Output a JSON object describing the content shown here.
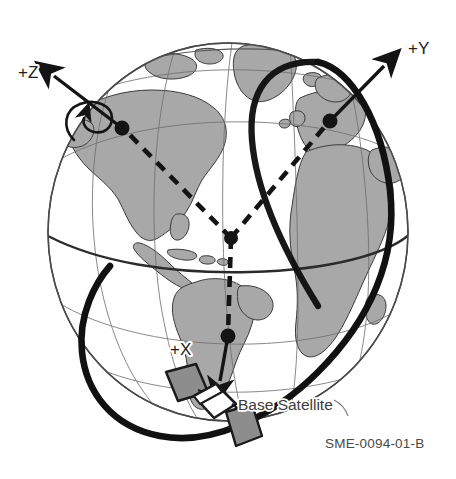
{
  "figure": {
    "background_color": "#ffffff",
    "width": 456,
    "height": 479
  },
  "globe": {
    "name": "earth-globe",
    "center": [
      228,
      232
    ],
    "radius_x": 180,
    "radius_y": 189,
    "ocean_color": "#ffffff",
    "land_color": "#a9a9a9",
    "land_outline_color": "#3b3b3b",
    "graticule_color": "#6e6e6e",
    "equator_color": "#2b2b2b",
    "outline_color": "#4a4a4a"
  },
  "axes": [
    {
      "id": "z",
      "label": "+Z",
      "label_position": [
        18,
        78
      ],
      "origin_dot": [
        122,
        128
      ],
      "arrow_tip": [
        44,
        66
      ],
      "has_rotation_curl": true,
      "color": "#141414"
    },
    {
      "id": "y",
      "label": "+Y",
      "label_position": [
        410,
        52
      ],
      "origin_dot": [
        330,
        121
      ],
      "arrow_tip": [
        390,
        62
      ],
      "has_rotation_curl": false,
      "color": "#141414"
    },
    {
      "id": "x",
      "label": "+X",
      "label_position": [
        172,
        351
      ],
      "origin_dot": [
        228,
        336
      ],
      "arrow_tip": [
        222,
        393
      ],
      "has_rotation_curl": false,
      "color": "#141414"
    }
  ],
  "frame_origin": {
    "name": "earth-center-node",
    "position": [
      231,
      238
    ],
    "color": "#141414"
  },
  "dashed_links": [
    {
      "from": "earth-center-node",
      "to": "z-axis-origin"
    },
    {
      "from": "earth-center-node",
      "to": "y-axis-origin"
    },
    {
      "from": "earth-center-node",
      "to": "x-axis-origin"
    }
  ],
  "orbit": {
    "name": "satellite-orbit-track",
    "color": "#111111",
    "stroke_width": 6.5,
    "inclined": true
  },
  "satellite": {
    "name": "base-satellite",
    "label": "Base Satellite",
    "label_position": [
      238,
      405
    ],
    "body_position": [
      207,
      405
    ],
    "body_color": "#ffffff",
    "body_outline_color": "#1a1a1a",
    "panel_color": "#8d8d8d",
    "panel_outline_color": "#1a1a1a",
    "panel_count": 2
  },
  "caption": {
    "name": "figure-code",
    "text": "SME-0094-01-B",
    "position": [
      325,
      448
    ],
    "color": "#4a4a4a"
  }
}
